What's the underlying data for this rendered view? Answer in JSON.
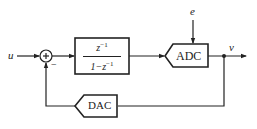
{
  "diagram": {
    "type": "block-diagram",
    "title": "",
    "input_label": "u",
    "output_label": "v",
    "noise_label": "e",
    "summing_junction": {
      "symbol": "+",
      "feedback_sign": "−"
    },
    "forward_block": {
      "numerator": "z",
      "numerator_exp": "−1",
      "denominator": "1−z",
      "denominator_exp": "−1"
    },
    "adc_label": "ADC",
    "dac_label": "DAC",
    "colors": {
      "line": "#222222",
      "background": "#ffffff"
    }
  }
}
